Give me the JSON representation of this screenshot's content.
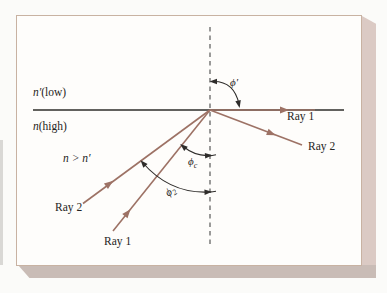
{
  "figure": {
    "labels": {
      "medium_low": {
        "symbol": "n′",
        "text": "(low)"
      },
      "medium_high": {
        "symbol": "n",
        "text": "(high)"
      },
      "index_condition": "n > n′",
      "ray1_refracted": "Ray 1",
      "ray2_reflected": "Ray 2",
      "ray2_incident": "Ray 2",
      "ray1_incident": "Ray 1",
      "angle_refraction": "ϕ′",
      "angle_critical": {
        "symbol": "ϕ",
        "sub": "c"
      },
      "angle_incidence": {
        "symbol": "ϕ",
        "sub": "2"
      }
    },
    "colors": {
      "ray": "#9d7265",
      "interface_line": "#2e2c2a",
      "normal_line": "#6f6f6f",
      "annotation": "#2e2c2a",
      "text": "#262422",
      "panel_background": "#fefdfb",
      "panel_border": "#c8b2a2",
      "panel_edge_right": "#dbcac4",
      "panel_edge_bottom": "#c9bcb6",
      "page_background": "#fbfbf9"
    }
  }
}
